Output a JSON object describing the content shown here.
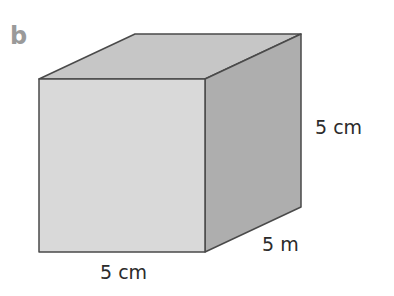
{
  "part_letter": "b",
  "shape": "cube",
  "labels": {
    "height": "5 cm",
    "depth": "5 m",
    "width": "5 cm"
  },
  "colors": {
    "front_face": "#d9d9d9",
    "top_face": "#c6c6c6",
    "right_face": "#aeaeae",
    "edge": "#4a4a4a"
  }
}
